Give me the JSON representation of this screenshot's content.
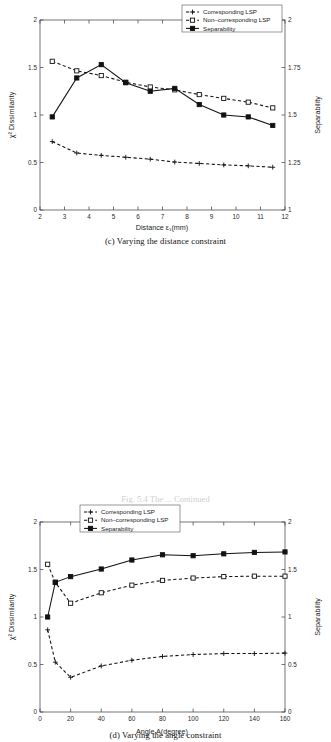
{
  "figure": {
    "bottom_caption_partial": "Fig. 5.4 The ... Continued"
  },
  "panels": [
    {
      "id": "c",
      "caption": "(c) Varying the distance constraint",
      "legend": {
        "items": [
          "Corresponding LSP",
          "Non-corresponding LSP",
          "Separability"
        ]
      }
    },
    {
      "id": "d",
      "caption": "(d) Varying the angle constraint",
      "legend": {
        "items": [
          "Corresponding LSP",
          "Non-corresponding LSP",
          "Separability"
        ]
      }
    }
  ],
  "chart_data": [
    {
      "type": "line",
      "panel": "c",
      "title": "(c) Varying the distance constraint",
      "xlabel": "Distance ε₁(mm)",
      "ylabel": "χ² Dissimilarity",
      "y2label": "Separability",
      "xlim": [
        2,
        12
      ],
      "ylim": [
        0,
        2
      ],
      "y2lim": [
        1,
        2
      ],
      "xticks": [
        2,
        3,
        4,
        5,
        6,
        7,
        8,
        9,
        10,
        11,
        12
      ],
      "xticklabels": [
        "2",
        "3",
        "4",
        "5",
        "6",
        "7",
        "8",
        "9",
        "10",
        "11",
        "12"
      ],
      "yticks": [
        0,
        0.5,
        1,
        1.5,
        2
      ],
      "yticklabels": [
        "0",
        "0.5",
        "1",
        "1.5",
        "2"
      ],
      "y2ticks": [
        1,
        1.25,
        1.5,
        1.75,
        2
      ],
      "y2ticklabels": [
        "1",
        "1.25",
        "1.5",
        "1.75",
        "2"
      ],
      "grid": false,
      "legend_position": "top-right",
      "x": [
        2.5,
        3.5,
        4.5,
        5.5,
        6.5,
        7.5,
        8.5,
        9.5,
        10.5,
        11.5
      ],
      "series": [
        {
          "name": "Corresponding LSP",
          "axis": "left",
          "style": "dashed",
          "marker": "plus",
          "values": [
            0.72,
            0.6,
            0.575,
            0.555,
            0.535,
            0.505,
            0.49,
            0.475,
            0.465,
            0.45
          ]
        },
        {
          "name": "Non-corresponding LSP",
          "axis": "left",
          "style": "dashed",
          "marker": "square-open",
          "values": [
            1.565,
            1.465,
            1.415,
            1.345,
            1.295,
            1.265,
            1.215,
            1.175,
            1.135,
            1.075
          ]
        },
        {
          "name": "Separability",
          "axis": "right",
          "style": "solid",
          "marker": "square-filled",
          "values": [
            1.49,
            1.695,
            1.765,
            1.67,
            1.625,
            1.64,
            1.555,
            1.5,
            1.49,
            1.445
          ]
        }
      ]
    },
    {
      "type": "line",
      "panel": "d",
      "title": "(d) Varying the angle constraint",
      "xlabel": "Angle A(degree)",
      "ylabel": "χ² Dissimilarity",
      "y2label": "Separability",
      "xlim": [
        0,
        160
      ],
      "ylim": [
        0,
        2
      ],
      "y2lim": [
        0,
        2
      ],
      "xticks": [
        0,
        20,
        40,
        60,
        80,
        100,
        120,
        140,
        160
      ],
      "xticklabels": [
        "0",
        "20",
        "40",
        "60",
        "80",
        "100",
        "120",
        "140",
        "160"
      ],
      "yticks": [
        0,
        0.5,
        1,
        1.5,
        2
      ],
      "yticklabels": [
        "0",
        "0.5",
        "1",
        "1.5",
        "2"
      ],
      "y2ticks": [
        0,
        0.5,
        1,
        1.5,
        2
      ],
      "y2ticklabels": [
        "0",
        "0.5",
        "1",
        "1.5",
        "2"
      ],
      "grid": false,
      "legend_position": "top-center",
      "x": [
        5,
        10,
        20,
        40,
        60,
        80,
        100,
        120,
        140,
        160
      ],
      "series": [
        {
          "name": "Corresponding LSP",
          "axis": "left",
          "style": "dashed",
          "marker": "plus",
          "values": [
            0.865,
            0.525,
            0.365,
            0.485,
            0.545,
            0.585,
            0.605,
            0.615,
            0.615,
            0.62
          ]
        },
        {
          "name": "Non-corresponding LSP",
          "axis": "left",
          "style": "dashed",
          "marker": "square-open",
          "values": [
            1.555,
            1.365,
            1.145,
            1.255,
            1.335,
            1.385,
            1.41,
            1.425,
            1.43,
            1.43
          ]
        },
        {
          "name": "Separability",
          "axis": "right",
          "style": "solid",
          "marker": "square-filled",
          "values": [
            1.0,
            1.365,
            1.425,
            1.505,
            1.6,
            1.655,
            1.645,
            1.665,
            1.68,
            1.685
          ]
        }
      ]
    }
  ]
}
